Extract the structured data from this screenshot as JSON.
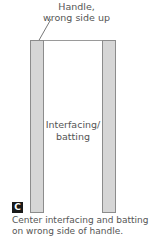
{
  "top_label": {
    "line1": "Handle,",
    "line2": "wrong side up"
  },
  "center_label": {
    "line1": "Interfacing/",
    "line2": "batting"
  },
  "step_badge": "C",
  "caption": {
    "line1": "Center interfacing and batting",
    "line2": "on wrong side of handle."
  },
  "colors": {
    "strip_fill": "#d6d6d6",
    "strip_border": "#8c8c8c",
    "badge_bg": "#1a1a1a",
    "text": "#555555"
  }
}
